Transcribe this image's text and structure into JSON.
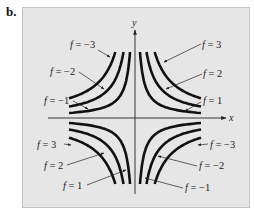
{
  "figure": {
    "label": "b.",
    "panel_bg": "#e6e6e6",
    "panel_border": "#bdbdbd",
    "curve_color": "#111111",
    "axis_color": "#222222",
    "axes": {
      "x_label": "x",
      "y_label": "y"
    },
    "function": "f(x, y) = xy (level curves)",
    "quadrants": [
      {
        "name": "top-left",
        "labels": [
          "f = −3",
          "f = −2",
          "f = −1"
        ]
      },
      {
        "name": "top-right",
        "labels": [
          "f = 3",
          "f = 2",
          "f = 1"
        ]
      },
      {
        "name": "bottom-left",
        "labels": [
          "f = 3",
          "f = 2",
          "f = 1"
        ]
      },
      {
        "name": "bottom-right",
        "labels": [
          "f = −3",
          "f = −2",
          "f = −1"
        ]
      }
    ]
  }
}
